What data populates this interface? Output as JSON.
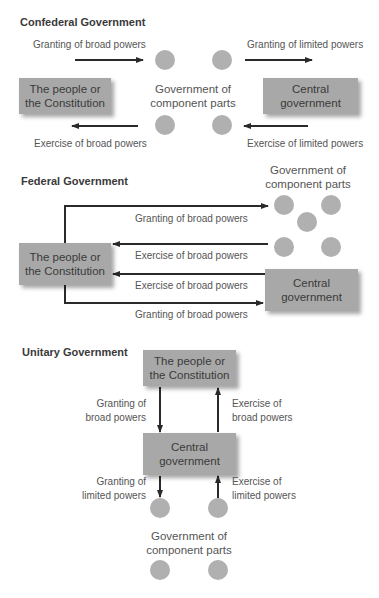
{
  "colors": {
    "box_fill": "#a8a8a8",
    "circle_fill": "#b0b0b0",
    "arrow": "#2a2a2a",
    "text": "#555555"
  },
  "confederal": {
    "title": "Confederal Government",
    "people_box": [
      "The people or",
      "the Constitution"
    ],
    "central_box": [
      "Central",
      "government"
    ],
    "components_label": [
      "Government of",
      "component parts"
    ],
    "arrows": {
      "granting_broad": "Granting of broad powers",
      "granting_limited": "Granting of limited powers",
      "exercise_broad": "Exercise of broad powers",
      "exercise_limited": "Exercise of limited powers"
    }
  },
  "federal": {
    "title": "Federal Government",
    "people_box": [
      "The people or",
      "the Constitution"
    ],
    "central_box": [
      "Central",
      "government"
    ],
    "components_label": [
      "Government of",
      "component parts"
    ],
    "arrows": {
      "granting_broad_to_components": "Granting of broad powers",
      "exercise_broad_from_components": "Exercise of broad powers",
      "exercise_broad_from_central": "Exercise of broad powers",
      "granting_broad_to_central": "Granting of broad powers"
    }
  },
  "unitary": {
    "title": "Unitary Government",
    "people_box": [
      "The people or",
      "the Constitution"
    ],
    "central_box": [
      "Central",
      "government"
    ],
    "components_label": [
      "Government of",
      "component parts"
    ],
    "arrows": {
      "granting_broad": [
        "Granting of",
        "broad powers"
      ],
      "exercise_broad": [
        "Exercise of",
        "broad powers"
      ],
      "granting_limited": [
        "Granting of",
        "limited powers"
      ],
      "exercise_limited": [
        "Exercise of",
        "limited powers"
      ]
    }
  }
}
